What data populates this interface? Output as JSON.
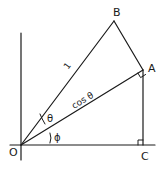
{
  "diagram": {
    "points": {
      "O": {
        "label": "O",
        "x": 21,
        "y": 145
      },
      "A": {
        "label": "A",
        "x": 143,
        "y": 70
      },
      "B": {
        "label": "B",
        "x": 114,
        "y": 21
      },
      "C": {
        "label": "C",
        "x": 143,
        "y": 145
      }
    },
    "segment_labels": {
      "OB": "1",
      "OA": "cos θ"
    },
    "angle_labels": {
      "theta": "θ",
      "phi": "ϕ"
    },
    "right_angles": [
      "OAB",
      "OCA"
    ]
  }
}
